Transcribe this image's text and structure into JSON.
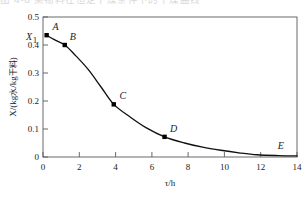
{
  "header": {
    "cropped_text": "图 4-8 某物料在恒定干燥条件下的干燥曲线"
  },
  "figure": {
    "name": "drying-curve"
  },
  "axis": {
    "x_title": "τ/h",
    "y_title_part1": "X/(kg",
    "y_title_cjk1": "水",
    "y_title_part2": "/kg",
    "y_title_cjk2": "干料",
    "y_title_close": ")",
    "y_title_full": "X/(kg水/kg干料)",
    "x_ticks": [
      "0",
      "2",
      "4",
      "6",
      "8",
      "10",
      "12",
      "14"
    ],
    "y_ticks": [
      "0",
      "0.1",
      "0.2",
      "0.3",
      "0.4",
      "0.5"
    ],
    "initial_label": "X",
    "initial_sub": "1"
  },
  "colors": {
    "axis": "#4a4a4a",
    "curve": "#111111",
    "marker": "#000000",
    "text": "#222222",
    "background": "#ffffff"
  },
  "chart_data": {
    "type": "line",
    "title": "",
    "xlabel": "τ/h",
    "ylabel": "X/(kg水/kg干料)",
    "xlim": [
      0,
      14
    ],
    "ylim": [
      0,
      0.5
    ],
    "xticks": [
      0,
      2,
      4,
      6,
      8,
      10,
      12,
      14
    ],
    "yticks": [
      0,
      0.1,
      0.2,
      0.3,
      0.4,
      0.5
    ],
    "grid": false,
    "legend": "none",
    "series": [
      {
        "name": "drying curve",
        "x": [
          0.2,
          0.6,
          1.2,
          1.8,
          2.5,
          3.2,
          3.9,
          4.8,
          5.7,
          6.7,
          7.8,
          8.8,
          9.8,
          10.8,
          11.8,
          13.0,
          14.0
        ],
        "y": [
          0.435,
          0.42,
          0.4,
          0.362,
          0.312,
          0.25,
          0.188,
          0.143,
          0.104,
          0.072,
          0.05,
          0.035,
          0.024,
          0.015,
          0.008,
          0.005,
          0.004
        ]
      }
    ],
    "markers": [
      {
        "label": "A",
        "x": 0.2,
        "y": 0.435,
        "label_dx": 9,
        "label_dy": -5
      },
      {
        "label": "B",
        "x": 1.2,
        "y": 0.4,
        "label_dx": 8,
        "label_dy": -5
      },
      {
        "label": "C",
        "x": 3.9,
        "y": 0.188,
        "label_dx": 9,
        "label_dy": -5
      },
      {
        "label": "D",
        "x": 6.7,
        "y": 0.072,
        "label_dx": 9,
        "label_dy": -5
      },
      {
        "label": "E",
        "x": 13.0,
        "y": 0.005,
        "label_dx": 2,
        "label_dy": -7,
        "hide_marker": true
      }
    ],
    "annotations": [
      {
        "text": "X₁",
        "x": 0.2,
        "y": 0.435,
        "note": "initial moisture content marker on y-axis"
      }
    ]
  }
}
